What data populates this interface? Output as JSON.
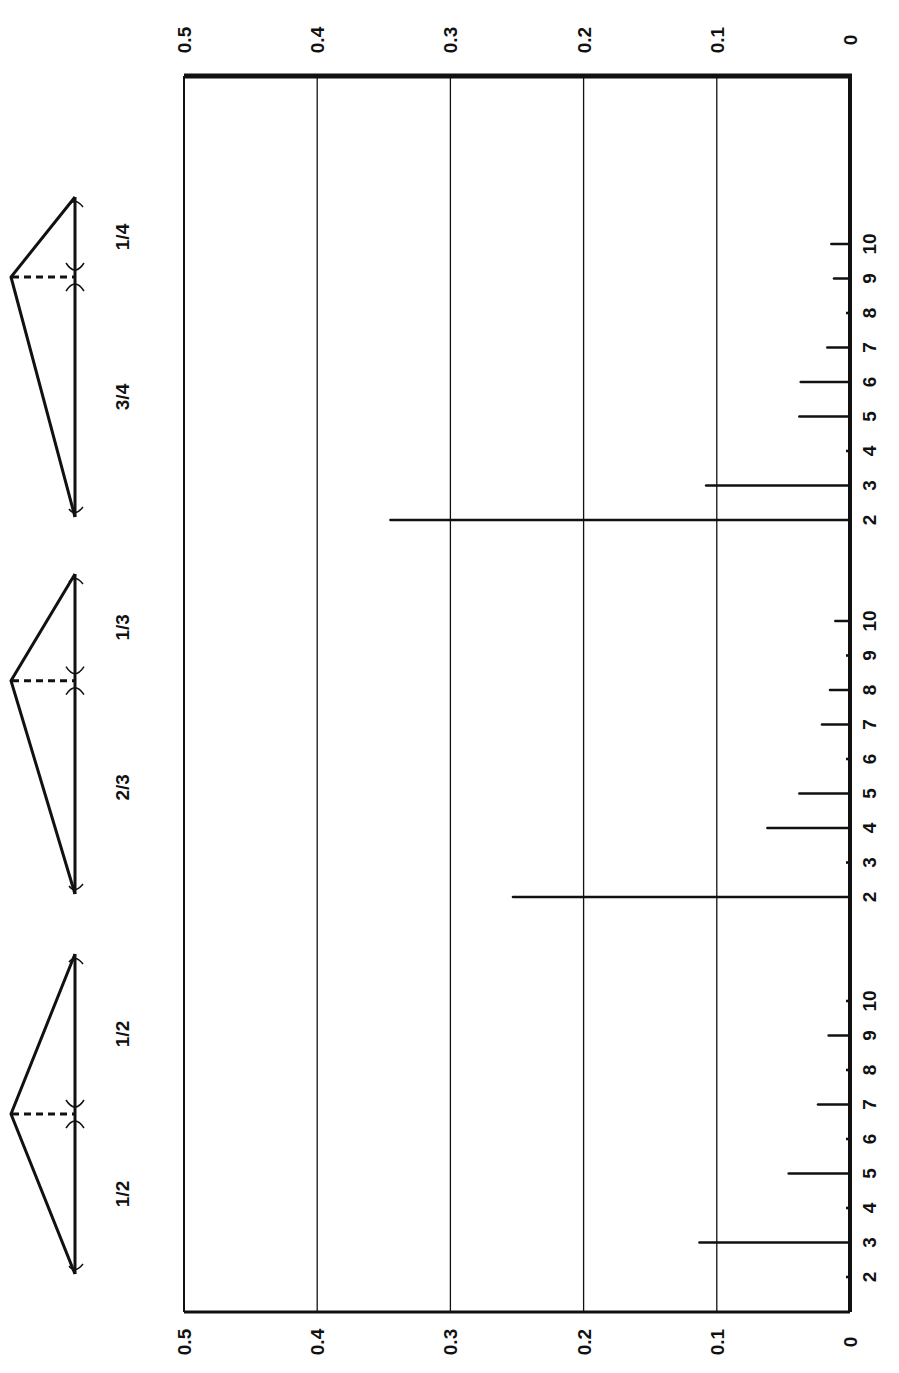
{
  "chart_data": {
    "type": "bar",
    "orientation": "horizontal (rotated figure: amplitude axis runs right-to-left, harmonic number runs top-to-bottom)",
    "title": "",
    "xlabel": "Relative amplitude",
    "ylabel": "Harmonic number",
    "value_axis": {
      "ticks": [
        "0",
        "0.1",
        "0.2",
        "0.3",
        "0.4",
        "0.5"
      ],
      "range": [
        0,
        0.5
      ],
      "grid": true,
      "labels_top": true,
      "labels_bottom": true
    },
    "harmonic_ticks": [
      "2",
      "3",
      "4",
      "5",
      "6",
      "7",
      "8",
      "9",
      "10"
    ],
    "groups": [
      {
        "name": "pluck-1-4",
        "diagram_labels": [
          "1/4",
          "3/4"
        ],
        "pluck_fraction": 0.25,
        "harmonics": [
          2,
          3,
          4,
          5,
          6,
          7,
          8,
          9,
          10
        ],
        "values": [
          0.345,
          0.108,
          0.0,
          0.038,
          0.037,
          0.017,
          0.0,
          0.012,
          0.014
        ]
      },
      {
        "name": "pluck-1-3",
        "diagram_labels": [
          "1/3",
          "2/3"
        ],
        "pluck_fraction": 0.3333,
        "harmonics": [
          2,
          3,
          4,
          5,
          6,
          7,
          8,
          9,
          10
        ],
        "values": [
          0.253,
          0.0,
          0.062,
          0.038,
          0.0,
          0.021,
          0.015,
          0.0,
          0.011
        ]
      },
      {
        "name": "pluck-1-2",
        "diagram_labels": [
          "1/2",
          "1/2"
        ],
        "pluck_fraction": 0.5,
        "harmonics": [
          2,
          3,
          4,
          5,
          6,
          7,
          8,
          9,
          10
        ],
        "values": [
          0.0,
          0.113,
          0.0,
          0.046,
          0.0,
          0.024,
          0.0,
          0.016,
          0.0
        ]
      }
    ]
  },
  "colors": {
    "ink": "#111111",
    "paper": "#ffffff"
  }
}
